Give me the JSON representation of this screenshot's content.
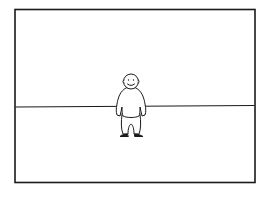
{
  "illustration": {
    "subject": "cartoon-figure-standing-on-horizon",
    "colors": {
      "background": "#ffffff",
      "stroke": "#1a1a1a"
    }
  }
}
